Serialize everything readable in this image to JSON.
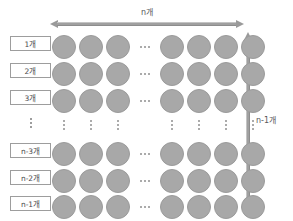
{
  "figure": {
    "background_color": "#ffffff",
    "circle_fill": "#a8a8a8",
    "circle_stroke": "#9b9b9b",
    "arrow_color": "#9a9a9a",
    "label_text_color": "#4a4a4c",
    "label_border_color": "#9d9d9d"
  },
  "top_measure": {
    "label": "n개",
    "orientation": "horizontal",
    "arrowheads": "both"
  },
  "right_measure": {
    "label": "n-1개",
    "orientation": "vertical",
    "arrowheads": "both"
  },
  "row_labels": [
    {
      "label": "1개",
      "type": "box"
    },
    {
      "label": "2개",
      "type": "box"
    },
    {
      "label": "3개",
      "type": "box"
    },
    {
      "label": "⋮",
      "type": "ellipsis"
    },
    {
      "label": "n-3개",
      "type": "box"
    },
    {
      "label": "n-2개",
      "type": "box"
    },
    {
      "label": "n-1개",
      "type": "box"
    }
  ],
  "grid": {
    "columns_left": 3,
    "columns_right": 4,
    "column_gap_marker": "⋯",
    "row_gap_marker": "⋮",
    "rows_top": 3,
    "rows_bottom": 3,
    "circle_glyph": "●"
  },
  "chart_data": {
    "type": "diagram",
    "columns_total_label": "n개",
    "rows_total_label": "n-1개",
    "row_counts": [
      "1개",
      "2개",
      "3개",
      "⋮",
      "n-3개",
      "n-2개",
      "n-1개"
    ],
    "visible_circle_columns": 7,
    "visible_circle_rows": 6,
    "horizontal_ellipsis_after_column": 3,
    "vertical_ellipsis_after_row": 3
  }
}
